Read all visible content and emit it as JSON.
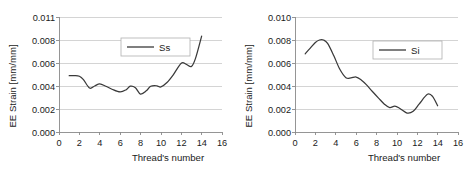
{
  "figure": {
    "panel_count": 2,
    "background_color": "#ffffff",
    "line_color": "#3a3a3a",
    "grid_color": "#c9c9c9",
    "axis_color": "#8a8a8a"
  },
  "chart_data": [
    {
      "id": "chart-ss",
      "type": "line",
      "title": "",
      "xlabel": "Thread's number",
      "ylabel": "EE Strain [mm/mm]",
      "xlim": [
        0,
        16
      ],
      "ylim": [
        0,
        0.011
      ],
      "grid": true,
      "legend_position": "upper-center",
      "xticks": [
        0,
        2,
        4,
        6,
        8,
        10,
        12,
        14,
        16
      ],
      "xtick_labels": [
        "0",
        "2",
        "4",
        "6",
        "8",
        "10",
        "12",
        "14",
        "16"
      ],
      "yticks": [
        0.0,
        0.002,
        0.004,
        0.006,
        0.008,
        0.011
      ],
      "ytick_labels": [
        "0.000",
        "0.002",
        "0.004",
        "0.006",
        "0.008",
        "0.011"
      ],
      "series": [
        {
          "name": "Ss",
          "x": [
            1.0,
            1.5,
            2.0,
            2.4,
            3.0,
            3.5,
            4.0,
            4.6,
            5.2,
            6.0,
            6.6,
            7.0,
            7.5,
            8.0,
            8.6,
            9.0,
            9.6,
            10.0,
            10.6,
            11.2,
            12.0,
            12.5,
            13.0,
            13.4,
            14.0
          ],
          "values": [
            0.0049,
            0.0049,
            0.00485,
            0.00455,
            0.00382,
            0.004,
            0.00418,
            0.00398,
            0.00372,
            0.00348,
            0.00368,
            0.00398,
            0.00385,
            0.0033,
            0.0036,
            0.00398,
            0.00402,
            0.00392,
            0.0043,
            0.00495,
            0.00598,
            0.00588,
            0.0057,
            0.0064,
            0.0085
          ]
        }
      ]
    },
    {
      "id": "chart-si",
      "type": "line",
      "title": "",
      "xlabel": "Thread's number",
      "ylabel": "EE Strain [mm/mm]",
      "xlim": [
        0,
        16
      ],
      "ylim": [
        0,
        0.01
      ],
      "grid": true,
      "legend_position": "upper-right",
      "xticks": [
        0,
        2,
        4,
        6,
        8,
        10,
        12,
        14,
        16
      ],
      "xtick_labels": [
        "0",
        "2",
        "4",
        "6",
        "8",
        "10",
        "12",
        "14",
        "16"
      ],
      "yticks": [
        0.0,
        0.002,
        0.004,
        0.006,
        0.008,
        0.01
      ],
      "ytick_labels": [
        "0.000",
        "0.002",
        "0.004",
        "0.006",
        "0.008",
        "0.010"
      ],
      "series": [
        {
          "name": "Si",
          "x": [
            1.0,
            1.5,
            2.0,
            2.4,
            2.8,
            3.2,
            3.8,
            4.4,
            5.0,
            5.5,
            6.0,
            6.5,
            7.0,
            7.6,
            8.2,
            8.8,
            9.3,
            9.8,
            10.3,
            11.0,
            11.6,
            12.2,
            13.0,
            13.5,
            14.0
          ],
          "values": [
            0.0068,
            0.0073,
            0.00778,
            0.008,
            0.008,
            0.0077,
            0.00665,
            0.00545,
            0.00472,
            0.0047,
            0.00478,
            0.00452,
            0.00412,
            0.00352,
            0.00295,
            0.0024,
            0.00212,
            0.00225,
            0.00205,
            0.00165,
            0.0018,
            0.00245,
            0.00328,
            0.0031,
            0.00228
          ]
        }
      ]
    }
  ]
}
